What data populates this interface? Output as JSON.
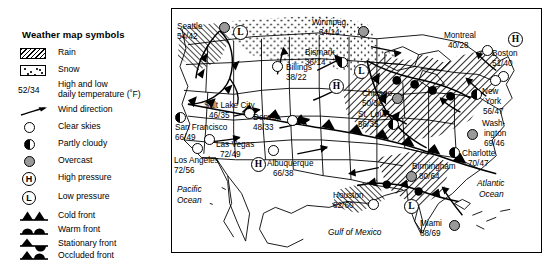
{
  "legend": {
    "title": "Weather map symbols",
    "temp_key": "52/34",
    "items": [
      {
        "symbol": "rain-hatch-swatch",
        "label": "Rain"
      },
      {
        "symbol": "snow-dot-swatch",
        "label": "Snow"
      },
      {
        "symbol": "temperature-key",
        "label": "High and low daily temperature (˚F)",
        "line1": "High and low",
        "line2": "daily temperature (˚F)"
      },
      {
        "symbol": "wind-arrow-icon",
        "label": "Wind direction"
      },
      {
        "symbol": "clear-skies-circle-icon",
        "label": "Clear skies"
      },
      {
        "symbol": "partly-cloudy-circle-icon",
        "label": "Partly cloudy"
      },
      {
        "symbol": "overcast-circle-icon",
        "label": "Overcast"
      },
      {
        "symbol": "high-pressure-icon",
        "label": "High pressure",
        "glyph": "H"
      },
      {
        "symbol": "low-pressure-icon",
        "label": "Low pressure",
        "glyph": "L"
      },
      {
        "symbol": "cold-front-icon",
        "label": "Cold front"
      },
      {
        "symbol": "warm-front-icon",
        "label": "Warm front"
      },
      {
        "symbol": "stationary-front-icon",
        "label": "Stationary front"
      },
      {
        "symbol": "occluded-front-icon",
        "label": "Occluded front"
      }
    ]
  },
  "map": {
    "stations": [
      {
        "name": "Seattle",
        "temp": "54/42",
        "sky": "overcast"
      },
      {
        "name": "Winnipeg",
        "temp": "34/14",
        "sky": "overcast"
      },
      {
        "name": "Montreal",
        "temp": "40/28",
        "sky": "clear"
      },
      {
        "name": "Boston",
        "temp": "51/40",
        "sky": "clear"
      },
      {
        "name": "Bismark",
        "temp": "36/14",
        "sky": "partly"
      },
      {
        "name": "Billings",
        "temp": "38/22",
        "sky": "clear"
      },
      {
        "name": "Chicago",
        "temp": "50/36",
        "sky": "overcast"
      },
      {
        "name": "New York",
        "temp": "56/47",
        "sky": "partly",
        "line1": "New",
        "line2": "York"
      },
      {
        "name": "Salt Lake City",
        "temp": "46/35",
        "sky": "clear"
      },
      {
        "name": "Denver",
        "temp": "48/33",
        "sky": "clear"
      },
      {
        "name": "St. Louis",
        "temp": "56/35",
        "sky": "partly"
      },
      {
        "name": "Washington",
        "temp": "69/46",
        "sky": "overcast",
        "line1": "Wash-",
        "line2": "ington"
      },
      {
        "name": "San Francisco",
        "temp": "66/49",
        "sky": "partly"
      },
      {
        "name": "Las Vegas",
        "temp": "72/49",
        "sky": "clear"
      },
      {
        "name": "Charlotte",
        "temp": "70/47",
        "sky": "partly"
      },
      {
        "name": "Los Angeles",
        "temp": "72/56",
        "sky": "clear"
      },
      {
        "name": "Albuquerque",
        "temp": "66/38",
        "sky": "clear"
      },
      {
        "name": "Birmingham",
        "temp": "80/64",
        "sky": "overcast"
      },
      {
        "name": "Houston",
        "temp": "82/60",
        "sky": "clear"
      },
      {
        "name": "Miami",
        "temp": "88/69",
        "sky": "overcast"
      }
    ],
    "pressure_centers": [
      {
        "type": "low",
        "glyph": "L",
        "near": "Seattle"
      },
      {
        "type": "high",
        "glyph": "H",
        "near": "Bismark"
      },
      {
        "type": "low",
        "glyph": "L",
        "near": "Chicago"
      },
      {
        "type": "high",
        "glyph": "H",
        "near": "Boston"
      },
      {
        "type": "high",
        "glyph": "H",
        "near": "Albuquerque"
      },
      {
        "type": "low",
        "glyph": "L",
        "near": "Gulf of Mexico"
      }
    ],
    "ocean_labels": [
      {
        "name": "Pacific Ocean",
        "line1": "Pacific",
        "line2": "Ocean"
      },
      {
        "name": "Atlantic Ocean",
        "line1": "Atlantic",
        "line2": "Ocean"
      },
      {
        "name": "Gulf of Mexico",
        "line1": "Gulf of Mexico",
        "line2": ""
      }
    ]
  },
  "colors": {
    "ink": "#000000",
    "overcast_fill": "#9a9a9a",
    "paper": "#ffffff"
  }
}
